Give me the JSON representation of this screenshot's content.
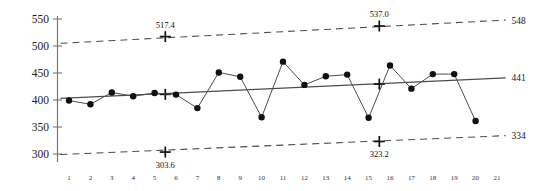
{
  "chart_data": {
    "type": "line",
    "title": "",
    "subtitle": "",
    "xlabel": "",
    "ylabel": "",
    "grid": false,
    "legend": "none",
    "xlim": [
      0.4,
      21.6
    ],
    "ylim": [
      285,
      560
    ],
    "y_ticks": [
      300,
      350,
      400,
      450,
      500,
      550
    ],
    "x_ticks": [
      1,
      2,
      3,
      4,
      5,
      6,
      7,
      8,
      9,
      10,
      11,
      12,
      13,
      14,
      15,
      16,
      17,
      18,
      19,
      20,
      21
    ],
    "x": [
      1,
      2,
      3,
      4,
      5,
      6,
      7,
      8,
      9,
      10,
      11,
      12,
      13,
      14,
      15,
      16,
      17,
      18,
      19,
      20
    ],
    "series": [
      {
        "name": "Observation",
        "style": "line-with-markers",
        "values": [
          399,
          392,
          414,
          407,
          413,
          410,
          385,
          451,
          443,
          368,
          471,
          428,
          444,
          447,
          367,
          464,
          421,
          448,
          448,
          361
        ]
      }
    ],
    "reference_lines": [
      {
        "name": "upper-control-limit",
        "style": "dashed",
        "start": {
          "x": 0.6,
          "y": 505
        },
        "end": {
          "x": 21.4,
          "y": 548
        },
        "end_label": "548",
        "marker": {
          "x": 5.5,
          "y": 517.4,
          "shape": "plus",
          "label": "517.4",
          "label_pos": "above"
        }
      },
      {
        "name": "center-line",
        "style": "solid",
        "start": {
          "x": 0.6,
          "y": 403
        },
        "end": {
          "x": 21.4,
          "y": 441
        },
        "end_label": "441",
        "marker": {
          "x": 5.5,
          "y": 410.5,
          "shape": "plus",
          "label": "",
          "label_pos": "none"
        }
      },
      {
        "name": "lower-control-limit",
        "style": "dashed",
        "start": {
          "x": 0.6,
          "y": 299
        },
        "end": {
          "x": 21.4,
          "y": 334
        },
        "end_label": "334",
        "marker": {
          "x": 5.5,
          "y": 303.6,
          "shape": "plus",
          "label": "303.6",
          "label_pos": "below"
        }
      }
    ],
    "annotations": [
      {
        "name": "ucl-mid-value",
        "text": "517.4",
        "x": 5.5,
        "y": 517.4
      },
      {
        "name": "lcl-mid-value",
        "text": "303.6",
        "x": 5.5,
        "y": 303.6
      },
      {
        "name": "ucl-right-value",
        "text": "537.0",
        "x": 15.5,
        "y": 537.0
      },
      {
        "name": "lcl-right-value",
        "text": "323.2",
        "x": 15.5,
        "y": 323.2
      }
    ],
    "extra_markers": [
      {
        "name": "ucl-marker-right",
        "x": 15.5,
        "y": 537.0,
        "shape": "plus",
        "label": "537.0"
      },
      {
        "name": "cl-marker-right",
        "x": 15.5,
        "y": 429.5,
        "shape": "plus",
        "label": ""
      },
      {
        "name": "lcl-marker-right",
        "x": 15.5,
        "y": 323.2,
        "shape": "plus",
        "label": "323.2"
      }
    ],
    "edge_labels": {
      "upper": "548",
      "center": "441",
      "lower": "334"
    },
    "colors": {
      "line": "#4d4d4d",
      "marker": "#111111",
      "limit": "#4d4d4d",
      "axis": "#777777",
      "text": "#1a1a1a",
      "background": "#ffffff"
    }
  }
}
